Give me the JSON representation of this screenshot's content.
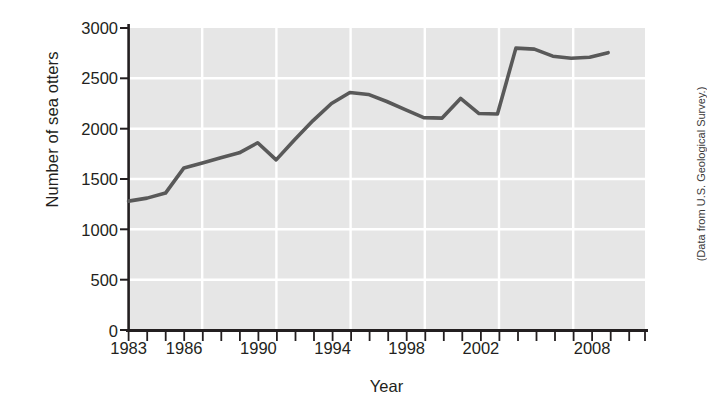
{
  "chart_data": {
    "type": "line",
    "title": "",
    "xlabel": "Year",
    "ylabel": "Number of sea otters",
    "source_note": "(Data from U.S. Geological Survey.)",
    "xlim": [
      1983,
      2011
    ],
    "ylim": [
      0,
      3000
    ],
    "ytick_values": [
      0,
      500,
      1000,
      1500,
      2000,
      2500,
      3000
    ],
    "ytick_labels": [
      "0",
      "500",
      "1000",
      "1500",
      "2000",
      "2500",
      "3000"
    ],
    "xtick_labels": [
      "1983",
      "1986",
      "1990",
      "1994",
      "1998",
      "2002",
      "2008"
    ],
    "xtick_label_values": [
      1983,
      1986,
      1990,
      1994,
      1998,
      2002,
      2008
    ],
    "x_minor_ticks_every": 1,
    "grid": "white gridlines on gray panel",
    "legend": "none",
    "line_color": "#595959",
    "panel_color": "#e6e6e6",
    "gridline_color": "#ffffff",
    "x": [
      1983,
      1984,
      1985,
      1986,
      1987,
      1988,
      1989,
      1990,
      1991,
      1992,
      1993,
      1994,
      1995,
      1996,
      1997,
      1998,
      1999,
      2000,
      2001,
      2002,
      2003,
      2004,
      2005,
      2006,
      2007,
      2008,
      2009
    ],
    "values": [
      1280,
      1310,
      1360,
      1610,
      1660,
      1710,
      1760,
      1860,
      1690,
      1890,
      2080,
      2250,
      2360,
      2340,
      2270,
      2190,
      2110,
      2105,
      2300,
      2150,
      2145,
      2800,
      2790,
      2720,
      2700,
      2710,
      2755
    ],
    "series": [
      {
        "name": "Number of sea otters",
        "values": [
          1280,
          1310,
          1360,
          1610,
          1660,
          1710,
          1760,
          1860,
          1690,
          1890,
          2080,
          2250,
          2360,
          2340,
          2270,
          2190,
          2110,
          2105,
          2300,
          2150,
          2145,
          2800,
          2790,
          2720,
          2700,
          2710,
          2755
        ]
      }
    ]
  }
}
